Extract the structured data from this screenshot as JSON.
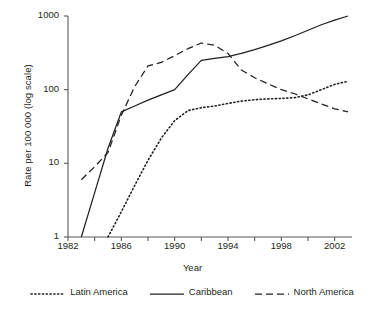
{
  "chart_data": {
    "type": "line",
    "title": "",
    "xlabel": "Year",
    "ylabel": "Rate per 100 000 (log scale)",
    "yscale": "log",
    "xlim": [
      1982,
      2003
    ],
    "ylim": [
      1,
      1000
    ],
    "yticks": [
      1,
      10,
      100,
      1000
    ],
    "ytick_labels": [
      "1",
      "10",
      "100",
      "1000"
    ],
    "xticks": [
      1982,
      1986,
      1990,
      1994,
      1998,
      2002
    ],
    "xtick_labels": [
      "1982",
      "1986",
      "1990",
      "1994",
      "1998",
      "2002"
    ],
    "x_minor_tick_interval": 2,
    "grid": false,
    "legend_position": "bottom",
    "series": [
      {
        "name": "Latin America",
        "style": "dotted",
        "color": "#231f20",
        "x": [
          1985,
          1986,
          1987,
          1988,
          1989,
          1990,
          1991,
          1992,
          1993,
          1994,
          1995,
          1996,
          1997,
          1998,
          1999,
          2000,
          2001,
          2002,
          2003
        ],
        "y": [
          1,
          2.2,
          5,
          11,
          22,
          38,
          52,
          57,
          60,
          65,
          70,
          73,
          75,
          76,
          78,
          85,
          100,
          118,
          130
        ]
      },
      {
        "name": "Caribbean",
        "style": "solid",
        "color": "#231f20",
        "x": [
          1983,
          1984,
          1985,
          1986,
          1987,
          1988,
          1989,
          1990,
          1991,
          1992,
          1993,
          1994,
          1995,
          1996,
          1997,
          1998,
          1999,
          2000,
          2001,
          2002,
          2003
        ],
        "y": [
          1,
          4,
          16,
          50,
          60,
          72,
          85,
          100,
          160,
          250,
          265,
          280,
          310,
          350,
          400,
          460,
          540,
          640,
          760,
          880,
          1000
        ]
      },
      {
        "name": "North America",
        "style": "dashed",
        "color": "#231f20",
        "x": [
          1983,
          1984,
          1985,
          1986,
          1987,
          1988,
          1989,
          1990,
          1991,
          1992,
          1993,
          1994,
          1995,
          1996,
          1997,
          1998,
          1999,
          2000,
          2001,
          2002,
          2003
        ],
        "y": [
          6,
          9,
          14,
          45,
          110,
          210,
          235,
          290,
          360,
          430,
          400,
          310,
          185,
          145,
          120,
          100,
          88,
          75,
          64,
          55,
          50
        ]
      }
    ]
  },
  "axes": {
    "ylabel": "Rate per 100 000 (log scale)",
    "xlabel": "Year"
  },
  "legend": {
    "items": [
      {
        "label": "Latin America",
        "style": "dotted"
      },
      {
        "label": "Caribbean",
        "style": "solid"
      },
      {
        "label": "North America",
        "style": "dashed"
      }
    ]
  }
}
